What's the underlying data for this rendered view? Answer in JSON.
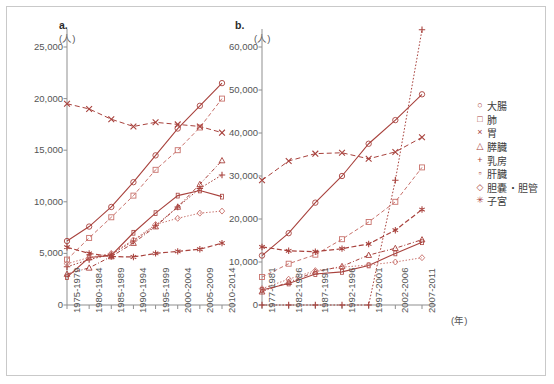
{
  "figure": {
    "panel_a_letter": "a.",
    "panel_b_letter": "b.",
    "unit_label": "(人)",
    "year_axis_label": "(年)"
  },
  "legend": {
    "items": [
      {
        "marker": "○",
        "label": "大腸",
        "key": "colon"
      },
      {
        "marker": "□",
        "label": "肺",
        "key": "lung"
      },
      {
        "marker": "×",
        "label": "胃",
        "key": "stomach"
      },
      {
        "marker": "△",
        "label": "膵臓",
        "key": "pancreas"
      },
      {
        "marker": "+",
        "label": "乳房",
        "key": "breast"
      },
      {
        "marker": "▫",
        "label": "肝臓",
        "key": "liver"
      },
      {
        "marker": "◇",
        "label": "胆嚢・胆管",
        "key": "gallbladder"
      },
      {
        "marker": "✳",
        "label": "子宮",
        "key": "uterus"
      }
    ]
  },
  "chart_data": [
    {
      "id": "a",
      "type": "line",
      "title": "a.",
      "xlabel": "",
      "ylabel": "(人)",
      "ylim": [
        0,
        25000
      ],
      "yticks": [
        0,
        5000,
        10000,
        15000,
        20000,
        25000
      ],
      "ytick_labels": [
        "0",
        "5,000",
        "10,000",
        "15,000",
        "20,000",
        "25,000"
      ],
      "grid": false,
      "legend_position": "right-outside",
      "categories": [
        "1975-1979",
        "1980-1984",
        "1985-1989",
        "1990-1994",
        "1995-1999",
        "2000-2004",
        "2005-2009",
        "2010-2014"
      ],
      "series": [
        {
          "name": "大腸",
          "marker": "○",
          "values": [
            6200,
            7600,
            9500,
            11900,
            14500,
            17100,
            19300,
            21500
          ]
        },
        {
          "name": "肺",
          "marker": "□",
          "values": [
            4400,
            6500,
            8500,
            10600,
            13100,
            15000,
            17200,
            20000
          ]
        },
        {
          "name": "胃",
          "marker": "×",
          "values": [
            19500,
            19000,
            18000,
            17300,
            17700,
            17500,
            17300,
            16700
          ]
        },
        {
          "name": "膵臓",
          "marker": "△",
          "values": [
            3000,
            3600,
            4700,
            6000,
            7600,
            9500,
            11700,
            14000
          ]
        },
        {
          "name": "乳房",
          "marker": "+",
          "values": [
            3700,
            4400,
            4900,
            6200,
            7700,
            9500,
            11300,
            12600
          ]
        },
        {
          "name": "肝臓",
          "marker": "▫",
          "values": [
            2700,
            4600,
            4800,
            7000,
            8900,
            10600,
            11100,
            10500
          ]
        },
        {
          "name": "胆嚢・胆管",
          "marker": "◇",
          "values": [
            4000,
            4600,
            5000,
            6300,
            7800,
            8400,
            8900,
            9100
          ]
        },
        {
          "name": "子宮",
          "marker": "✳",
          "values": [
            5600,
            5000,
            4700,
            4650,
            5000,
            5200,
            5400,
            6000
          ]
        }
      ]
    },
    {
      "id": "b",
      "type": "line",
      "title": "b.",
      "xlabel": "(年)",
      "ylabel": "(人)",
      "ylim": [
        0,
        60000
      ],
      "yticks": [
        0,
        10000,
        20000,
        30000,
        40000,
        50000,
        60000
      ],
      "ytick_labels": [
        "0",
        "10,000",
        "20,000",
        "30,000",
        "40,000",
        "50,000",
        "60,000"
      ],
      "grid": false,
      "legend_position": "right-outside",
      "categories": [
        "1977-1981",
        "1982-1986",
        "1987-1991",
        "1992-1996",
        "1997-2001",
        "2002-2006",
        "2007-2011"
      ],
      "series": [
        {
          "name": "大腸",
          "marker": "○",
          "values": [
            11500,
            16700,
            23800,
            30000,
            37500,
            43000,
            49000
          ]
        },
        {
          "name": "肺",
          "marker": "□",
          "values": [
            6500,
            9600,
            11700,
            15300,
            19300,
            24000,
            32000
          ]
        },
        {
          "name": "胃",
          "marker": "×",
          "values": [
            29000,
            33500,
            35200,
            35400,
            34000,
            35600,
            39000
          ]
        },
        {
          "name": "膵臓",
          "marker": "△",
          "values": [
            3100,
            5300,
            7700,
            9000,
            11600,
            13200,
            15200
          ]
        },
        {
          "name": "乳房",
          "marker": "+",
          "values": [
            0,
            0,
            0,
            0,
            0,
            29000,
            64000
          ]
        },
        {
          "name": "肝臓",
          "marker": "▫",
          "values": [
            3500,
            5000,
            7200,
            7700,
            9200,
            12000,
            14600
          ]
        },
        {
          "name": "胆嚢・胆管",
          "marker": "◇",
          "values": [
            3800,
            6000,
            8000,
            8800,
            9300,
            10000,
            11000
          ]
        },
        {
          "name": "子宮",
          "marker": "✳",
          "values": [
            13500,
            12600,
            12400,
            13100,
            14200,
            17400,
            22200
          ]
        }
      ]
    }
  ]
}
